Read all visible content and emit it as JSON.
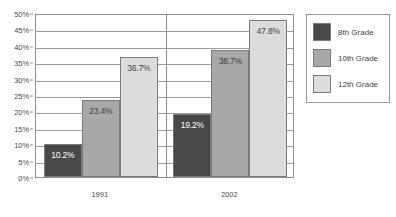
{
  "chart_data": {
    "type": "bar",
    "title": "",
    "subtitle": "",
    "xlabel": "",
    "ylabel": "",
    "categories": [
      "1991",
      "2002"
    ],
    "series": [
      {
        "name": "8th Grade",
        "color": "#484848",
        "values": [
          10.2,
          19.2
        ],
        "labels": [
          "10.2%",
          "19.2%"
        ]
      },
      {
        "name": "10th Grade",
        "color": "#a8a8a8",
        "values": [
          23.4,
          38.7
        ],
        "labels": [
          "23.4%",
          "38.7%"
        ]
      },
      {
        "name": "12th Grade",
        "color": "#dcdcdc",
        "values": [
          36.7,
          47.8
        ],
        "labels": [
          "36.7%",
          "47.8%"
        ]
      }
    ],
    "ylim": [
      0,
      50
    ],
    "ytick_step": 5,
    "ytick_labels": [
      "0%",
      "5%",
      "10%",
      "15%",
      "20%",
      "25%",
      "30%",
      "35%",
      "40%",
      "45%",
      "50%"
    ],
    "grid": true,
    "legend_position": "right",
    "value_label_position": "inside-top"
  },
  "legend": {
    "items": [
      {
        "label": "8th Grade",
        "color": "#484848"
      },
      {
        "label": "10th Grade",
        "color": "#a8a8a8"
      },
      {
        "label": "12th Grade",
        "color": "#dcdcdc"
      }
    ]
  },
  "axis": {
    "x_labels": [
      "1991",
      "2002"
    ],
    "y_labels": [
      "0%",
      "5%",
      "10%",
      "15%",
      "20%",
      "25%",
      "30%",
      "35%",
      "40%",
      "45%",
      "50%"
    ]
  }
}
